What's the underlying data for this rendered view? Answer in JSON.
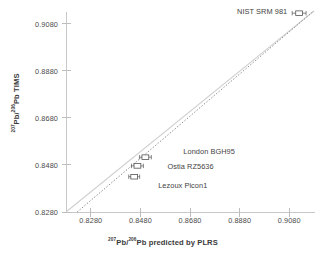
{
  "chart_data": {
    "type": "scatter",
    "title": "",
    "xlabel": "207Pb/206Pb predicted by PLRS",
    "ylabel": "207Pb/206Pb TIMS",
    "xlabel_html": "<sup>207</sup>Pb/<sup>206</sup>Pb predicted by PLRS",
    "ylabel_html": "<sup>207</sup>Pb/<sup>206</sup>Pb TIMS",
    "xlim": [
      0.818,
      0.918
    ],
    "ylim": [
      0.828,
      0.913
    ],
    "xticks": [
      0.828,
      0.848,
      0.868,
      0.888,
      0.908
    ],
    "yticks": [
      0.828,
      0.848,
      0.868,
      0.888,
      0.908
    ],
    "xticklabels": [
      "0.8280",
      "0.8480",
      "0.8680",
      "0.8880",
      "0.9080"
    ],
    "yticklabels": [
      "0.8280",
      "0.8480",
      "0.8680",
      "0.8880",
      "0.9080"
    ],
    "grid": false,
    "legend": null,
    "marker": "open-rectangle-with-horizontal-error-bars",
    "points": [
      {
        "name": "Lezoux Picon1",
        "x": 0.8455,
        "y": 0.843,
        "xerr": 0.0022,
        "label_dx": 24,
        "label_dy": 8
      },
      {
        "name": "Ostia RZ5636",
        "x": 0.8468,
        "y": 0.8476,
        "xerr": 0.0024,
        "label_dx": 30,
        "label_dy": 0
      },
      {
        "name": "London BGH95",
        "x": 0.85,
        "y": 0.8513,
        "xerr": 0.0024,
        "label_dx": 38,
        "label_dy": -6
      },
      {
        "name": "NIST SRM 981",
        "x": 0.912,
        "y": 0.9125,
        "xerr": 0.0028,
        "label_dx": -62,
        "label_dy": -2
      }
    ],
    "lines": [
      {
        "name": "one-to-one-line",
        "style": "solid",
        "color": "#d0d0d0",
        "from": [
          0.818,
          0.828
        ],
        "to": [
          0.918,
          0.9135
        ]
      },
      {
        "name": "regression-line",
        "style": "dotted",
        "color": "#7d7d7d",
        "from": [
          0.8225,
          0.828
        ],
        "to": [
          0.918,
          0.9135
        ]
      }
    ]
  },
  "axes": {
    "x_title_prefix_sup": "207",
    "x_title_mid": "Pb/",
    "x_title_sup2": "206",
    "x_title_suffix": "Pb predicted by PLRS",
    "y_title_prefix_sup": "207",
    "y_title_mid": "Pb/",
    "y_title_sup2": "206",
    "y_title_suffix": "Pb TIMS"
  },
  "colors": {
    "axis": "#c8c8c8",
    "tick": "#bdbdbd",
    "text": "#3a3a3a",
    "identity_line": "#d0d0d0",
    "fit_line": "#7d7d7d",
    "marker_stroke": "#555555",
    "background": "#ffffff"
  }
}
